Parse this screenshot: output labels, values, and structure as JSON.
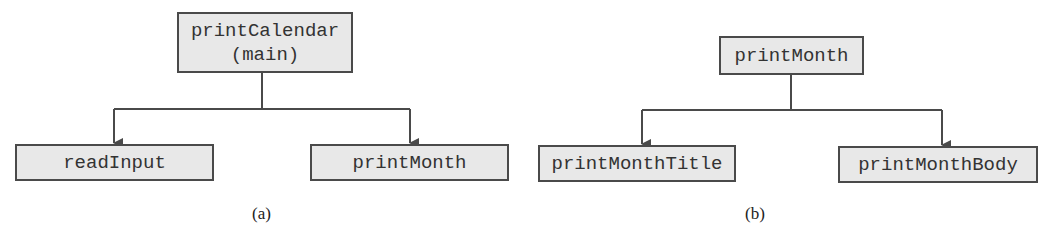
{
  "figure": {
    "panels": [
      {
        "id": "a",
        "caption": "(a)",
        "root": {
          "label_line1": "printCalendar",
          "label_line2": "(main)"
        },
        "children": [
          {
            "label": "readInput"
          },
          {
            "label": "printMonth"
          }
        ]
      },
      {
        "id": "b",
        "caption": "(b)",
        "root": {
          "label": "printMonth"
        },
        "children": [
          {
            "label": "printMonthTitle"
          },
          {
            "label": "printMonthBody"
          }
        ]
      }
    ],
    "colors": {
      "box_fill": "#e8e8e8",
      "box_border": "#4a4a4a",
      "line": "#4a4a4a",
      "text": "#333333"
    }
  }
}
